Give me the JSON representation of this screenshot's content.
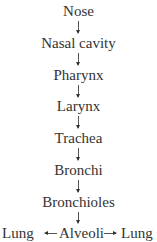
{
  "diagram": {
    "title": "",
    "nodes": [
      {
        "id": "nose",
        "label": "Nose"
      },
      {
        "id": "nasal_cavity",
        "label": "Nasal cavity"
      },
      {
        "id": "pharynx",
        "label": "Pharynx"
      },
      {
        "id": "larynx",
        "label": "Larynx"
      },
      {
        "id": "trachea",
        "label": "Trachea"
      },
      {
        "id": "bronchi",
        "label": "Bronchi"
      },
      {
        "id": "bronchioles",
        "label": "Bronchioles"
      }
    ],
    "bottom": {
      "left": "Lung",
      "center": "Alveoli",
      "right": "Lung"
    },
    "edges": [
      {
        "from": "Nose",
        "to": "Nasal cavity"
      },
      {
        "from": "Nasal cavity",
        "to": "Pharynx"
      },
      {
        "from": "Pharynx",
        "to": "Larynx"
      },
      {
        "from": "Larynx",
        "to": "Trachea"
      },
      {
        "from": "Trachea",
        "to": "Bronchi"
      },
      {
        "from": "Bronchi",
        "to": "Bronchioles"
      },
      {
        "from": "Bronchioles",
        "to": "Alveoli"
      },
      {
        "from": "Alveoli",
        "to": "Lung (left)"
      },
      {
        "from": "Alveoli",
        "to": "Lung (right)"
      }
    ]
  }
}
